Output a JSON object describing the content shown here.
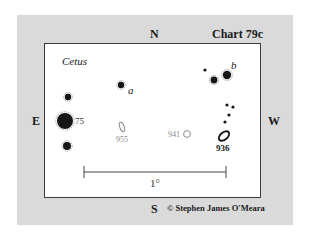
{
  "chart": {
    "title": "Chart 79c",
    "constellation": "Cetus",
    "directions": {
      "north": "N",
      "south": "S",
      "east": "E",
      "west": "W"
    },
    "scale_label": "1°",
    "copyright": "© Stephen James O'Meara"
  },
  "stars": [
    {
      "id": "star-upper-left",
      "x": 68,
      "y": 97,
      "r": 3.2,
      "label": ""
    },
    {
      "id": "star-75",
      "x": 65,
      "y": 121,
      "r": 8,
      "label": "75"
    },
    {
      "id": "star-lower-left",
      "x": 67,
      "y": 146,
      "r": 4,
      "label": ""
    },
    {
      "id": "star-a",
      "x": 121,
      "y": 85,
      "r": 3.2,
      "label": "a"
    },
    {
      "id": "star-small-ne",
      "x": 205,
      "y": 70,
      "r": 1.6,
      "label": ""
    },
    {
      "id": "star-mid-ne",
      "x": 214,
      "y": 80,
      "r": 3.4,
      "label": ""
    },
    {
      "id": "star-b",
      "x": 227,
      "y": 75,
      "r": 4.2,
      "label": "b"
    },
    {
      "id": "star-chain-1",
      "x": 227,
      "y": 105,
      "r": 1.6,
      "label": ""
    },
    {
      "id": "star-chain-2",
      "x": 233,
      "y": 107,
      "r": 1.6,
      "label": ""
    },
    {
      "id": "star-chain-3",
      "x": 229,
      "y": 115,
      "r": 1.6,
      "label": ""
    },
    {
      "id": "star-chain-4",
      "x": 225,
      "y": 122,
      "r": 1.6,
      "label": ""
    }
  ],
  "galaxies": [
    {
      "id": "ngc-955",
      "label": "955",
      "x": 122,
      "y": 127,
      "rx": 2.2,
      "ry": 5,
      "rot": -20
    },
    {
      "id": "ngc-941",
      "label": "941",
      "x": 187,
      "y": 134,
      "rx": 3.4,
      "ry": 3.4,
      "rot": 0
    },
    {
      "id": "ngc-936",
      "label": "936",
      "x": 224,
      "y": 136,
      "rx": 6,
      "ry": 3.6,
      "rot": -40
    }
  ]
}
